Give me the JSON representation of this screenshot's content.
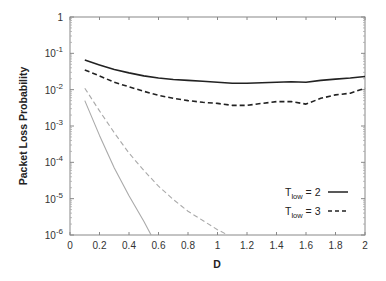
{
  "chart_data": {
    "type": "line",
    "title": "",
    "xlabel": "D",
    "ylabel": "Packet Loss Probability",
    "xlim": [
      0,
      2
    ],
    "ylim": [
      1e-06,
      1
    ],
    "yscale": "log",
    "grid": false,
    "legend_position": "lower right",
    "x_ticks": [
      0,
      0.2,
      0.4,
      0.6,
      0.8,
      1,
      1.2,
      1.4,
      1.6,
      1.8,
      2
    ],
    "x_tick_labels": [
      "0",
      "0.2",
      "0.4",
      "0.6",
      "0.8",
      "1",
      "1.2",
      "1.4",
      "1.6",
      "1.8",
      "2"
    ],
    "y_ticks": [
      1e-06,
      1e-05,
      0.0001,
      0.001,
      0.01,
      0.1,
      1
    ],
    "y_tick_labels": [
      {
        "base": "10",
        "exp": "-6"
      },
      {
        "base": "10",
        "exp": "-5"
      },
      {
        "base": "10",
        "exp": "-4"
      },
      {
        "base": "10",
        "exp": "-3"
      },
      {
        "base": "10",
        "exp": "-2"
      },
      {
        "base": "10",
        "exp": "-1"
      },
      {
        "base": "1",
        "exp": ""
      }
    ],
    "legend": [
      {
        "label_main": "T",
        "label_sub": "low",
        "label_rest": " = 2",
        "style": "solid",
        "color": "#222222"
      },
      {
        "label_main": "T",
        "label_sub": "low",
        "label_rest": " = 3",
        "style": "dashed",
        "color": "#222222"
      }
    ],
    "series": [
      {
        "name": "T_low = 2",
        "style": "solid",
        "color": "#222222",
        "width": 1.6,
        "x": [
          0.1,
          0.2,
          0.3,
          0.4,
          0.5,
          0.6,
          0.7,
          0.8,
          0.9,
          1.0,
          1.1,
          1.2,
          1.3,
          1.4,
          1.5,
          1.6,
          1.7,
          1.8,
          1.9,
          2.0
        ],
        "y": [
          0.065,
          0.048,
          0.036,
          0.029,
          0.024,
          0.021,
          0.019,
          0.018,
          0.017,
          0.016,
          0.015,
          0.015,
          0.0155,
          0.016,
          0.0165,
          0.016,
          0.018,
          0.0195,
          0.021,
          0.023
        ]
      },
      {
        "name": "T_low = 3",
        "style": "dashed",
        "color": "#222222",
        "width": 1.6,
        "x": [
          0.1,
          0.2,
          0.3,
          0.4,
          0.5,
          0.6,
          0.7,
          0.8,
          0.9,
          1.0,
          1.1,
          1.2,
          1.3,
          1.4,
          1.5,
          1.6,
          1.7,
          1.8,
          1.9,
          2.0
        ],
        "y": [
          0.035,
          0.024,
          0.016,
          0.012,
          0.009,
          0.007,
          0.0058,
          0.005,
          0.0045,
          0.0042,
          0.0037,
          0.0037,
          0.0042,
          0.0047,
          0.0047,
          0.004,
          0.0058,
          0.0072,
          0.008,
          0.011
        ]
      },
      {
        "name": "light dashed (unlabeled)",
        "style": "dashed",
        "color": "#aaaaaa",
        "width": 1.1,
        "x": [
          0.1,
          0.2,
          0.3,
          0.4,
          0.5,
          0.6,
          0.7,
          0.8,
          0.9,
          1.0,
          1.07
        ],
        "y": [
          0.011,
          0.0026,
          0.00065,
          0.00018,
          6e-05,
          2.2e-05,
          9.5e-06,
          4.5e-06,
          2.5e-06,
          1.4e-06,
          1e-06
        ]
      },
      {
        "name": "light solid (unlabeled)",
        "style": "solid",
        "color": "#aaaaaa",
        "width": 1.1,
        "x": [
          0.1,
          0.2,
          0.3,
          0.4,
          0.5,
          0.55
        ],
        "y": [
          0.005,
          0.00055,
          7e-05,
          1.2e-05,
          2.4e-06,
          1e-06
        ]
      }
    ]
  }
}
